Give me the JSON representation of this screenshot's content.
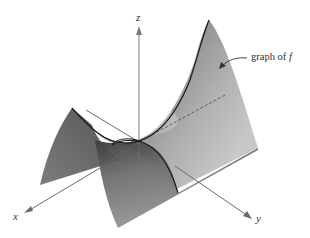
{
  "diagram": {
    "type": "3d-surface-plot",
    "axes": {
      "x": {
        "label": "x"
      },
      "y": {
        "label": "y"
      },
      "z": {
        "label": "z"
      }
    },
    "annotation": {
      "text_plain": "graph of ",
      "text_italic": "f"
    },
    "colors": {
      "surface_dark": "#4a4a4a",
      "surface_mid": "#8a8a8a",
      "surface_light": "#d6d6d6",
      "axis": "#7a7a7a",
      "curve": "#1a1a1a"
    }
  }
}
